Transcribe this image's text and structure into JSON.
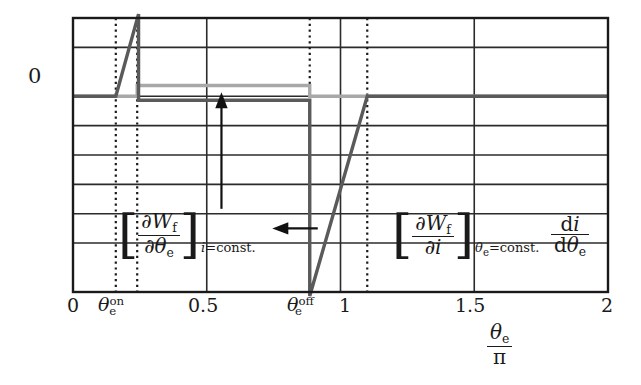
{
  "chart_data": {
    "type": "line",
    "title": "",
    "xlabel_numerator": "θe",
    "xlabel_denominator": "π",
    "xlabel": "θe/π",
    "ylabel": "",
    "xlim": [
      0,
      2
    ],
    "ylim": [
      -1.0,
      0.4
    ],
    "grid": true,
    "legend": "none",
    "xticks": [
      {
        "value": 0,
        "label": "0"
      },
      {
        "value": 0.5,
        "label": "0.5"
      },
      {
        "value": 1,
        "label": "1"
      },
      {
        "value": 1.5,
        "label": "1.5"
      },
      {
        "value": 2,
        "label": "2"
      }
    ],
    "yticks": [
      {
        "value": 0,
        "label": "0"
      }
    ],
    "special_xticks": [
      {
        "value": 0.16,
        "label": "θe^on"
      },
      {
        "value": 0.885,
        "label": "θe^off"
      }
    ],
    "vertical_dotted_lines": [
      0.16,
      0.24,
      0.885,
      1.1
    ],
    "horizontal_gridlines_y": [
      0.4,
      0.25,
      0.0,
      -0.15,
      -0.3,
      -0.45,
      -0.6,
      -0.75,
      -1.0
    ],
    "series": [
      {
        "name": "[∂Wf/∂θe]_{i=const.}",
        "color": "#5a5a5a",
        "width": 3.4,
        "points": [
          [
            0.0,
            0.0
          ],
          [
            0.16,
            0.0
          ],
          [
            0.245,
            0.42
          ],
          [
            0.245,
            -0.02
          ],
          [
            0.885,
            -0.02
          ],
          [
            0.885,
            -1.02
          ],
          [
            1.1,
            0.0
          ],
          [
            2.0,
            0.0
          ]
        ]
      },
      {
        "name": "di/dθe",
        "color": "#a8a8a8",
        "width": 3.4,
        "points": [
          [
            0.0,
            0.0
          ],
          [
            0.24,
            0.0
          ],
          [
            0.24,
            0.055
          ],
          [
            0.885,
            0.055
          ],
          [
            0.885,
            0.0
          ],
          [
            2.0,
            0.0
          ]
        ]
      }
    ],
    "annotations": [
      {
        "name": "torque-term",
        "latex": "[∂Wf/∂θe]_{i=const.}",
        "bracket_open": "[",
        "bracket_close": "]",
        "numerator": "∂Wf",
        "denominator": "∂θe",
        "subscript": "i=const."
      },
      {
        "name": "flux-linkage-term",
        "latex": "[∂Wf/∂i]_{θe=const.}",
        "bracket_open": "[",
        "bracket_close": "]",
        "numerator": "∂Wf",
        "denominator": "∂i",
        "subscript": "θe=const."
      },
      {
        "name": "current-slope-term",
        "latex": "di/dθe",
        "numerator": "di",
        "denominator": "dθe"
      }
    ],
    "arrows": [
      {
        "name": "up-arrow-to-torque-curve",
        "direction": "up",
        "x": 0.555,
        "y_from": -0.575,
        "y_to": 0.02
      },
      {
        "name": "left-arrow-to-current-curve",
        "direction": "left",
        "y": -0.675,
        "x_from": 0.915,
        "x_to": 0.745
      }
    ]
  },
  "axis": {
    "y_zero_label": "0",
    "x_tick_0": "0",
    "x_tick_05": "0.5",
    "x_tick_1": "1",
    "x_tick_15": "1.5",
    "x_tick_2": "2",
    "theta_on_base": "θ",
    "theta_on_sub": "e",
    "theta_on_sup": "on",
    "theta_off_base": "θ",
    "theta_off_sub": "e",
    "theta_off_sup": "off",
    "xlabel_num_base": "θ",
    "xlabel_num_sub": "e",
    "xlabel_den": "π"
  },
  "math": {
    "partial": "∂",
    "d_upright": "d",
    "W": "W",
    "f_sub": "f",
    "theta": "θ",
    "e_sub": "e",
    "i": "i",
    "eq_const": "=const.",
    "bracket_left": "[",
    "bracket_right": "]"
  },
  "colors": {
    "frame": "#1a1a1a",
    "grid": "#2b2b2b",
    "dark_curve": "#5a5a5a",
    "light_curve": "#a8a8a8",
    "dotted": "#1a1a1a",
    "text": "#1a1a1a",
    "background": "#ffffff"
  }
}
